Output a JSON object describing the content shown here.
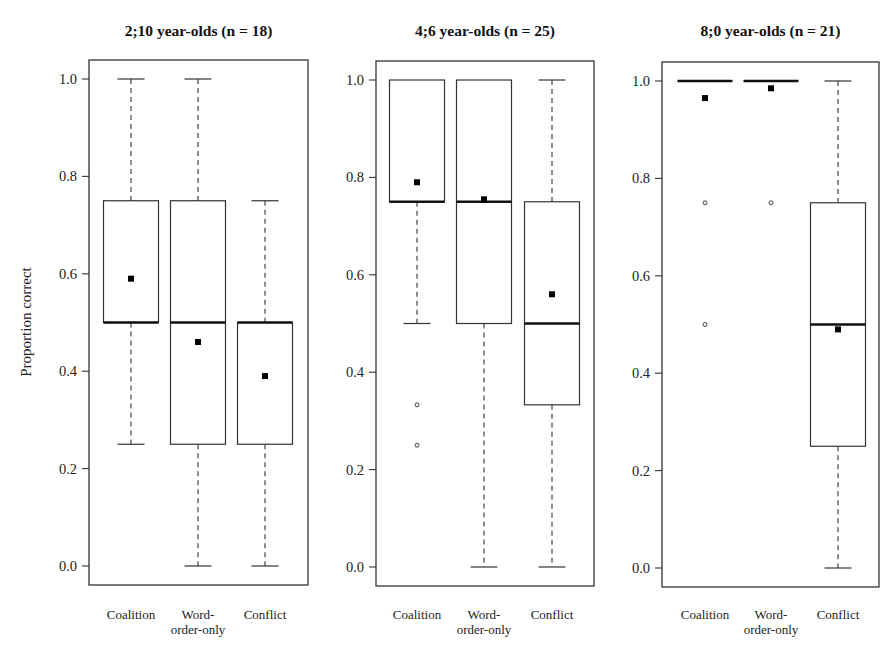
{
  "chart_data": {
    "type": "boxplot",
    "ylabel": "Proportion correct",
    "ylim": [
      0.0,
      1.0
    ],
    "yticks": [
      "0.0",
      "0.2",
      "0.4",
      "0.6",
      "0.8",
      "1.0"
    ],
    "categories": [
      "Coalition",
      "Word-\norder-only",
      "Conflict"
    ],
    "legend": "none; filled squares = means, open circles = outliers",
    "panels": [
      {
        "title": "2;10 year-olds (n = 18)",
        "series": [
          {
            "name": "Coalition",
            "min": 0.25,
            "q1": 0.5,
            "median": 0.5,
            "q3": 0.75,
            "max": 1.0,
            "mean": 0.59,
            "outliers": []
          },
          {
            "name": "Word-order-only",
            "min": 0.0,
            "q1": 0.25,
            "median": 0.5,
            "q3": 0.75,
            "max": 1.0,
            "mean": 0.46,
            "outliers": []
          },
          {
            "name": "Conflict",
            "min": 0.0,
            "q1": 0.25,
            "median": 0.5,
            "q3": 0.5,
            "max": 0.75,
            "mean": 0.39,
            "outliers": []
          }
        ]
      },
      {
        "title": "4;6 year-olds (n = 25)",
        "series": [
          {
            "name": "Coalition",
            "min": 0.5,
            "q1": 0.75,
            "median": 0.75,
            "q3": 1.0,
            "max": 1.0,
            "mean": 0.79,
            "outliers": [
              0.333,
              0.25
            ]
          },
          {
            "name": "Word-order-only",
            "min": 0.0,
            "q1": 0.5,
            "median": 0.75,
            "q3": 1.0,
            "max": 1.0,
            "mean": 0.755,
            "outliers": []
          },
          {
            "name": "Conflict",
            "min": 0.0,
            "q1": 0.333,
            "median": 0.5,
            "q3": 0.75,
            "max": 1.0,
            "mean": 0.56,
            "outliers": []
          }
        ]
      },
      {
        "title": "8;0 year-olds (n = 21)",
        "series": [
          {
            "name": "Coalition",
            "min": 1.0,
            "q1": 1.0,
            "median": 1.0,
            "q3": 1.0,
            "max": 1.0,
            "mean": 0.965,
            "outliers": [
              0.75,
              0.5
            ]
          },
          {
            "name": "Word-order-only",
            "min": 1.0,
            "q1": 1.0,
            "median": 1.0,
            "q3": 1.0,
            "max": 1.0,
            "mean": 0.985,
            "outliers": [
              0.75
            ]
          },
          {
            "name": "Conflict",
            "min": 0.0,
            "q1": 0.25,
            "median": 0.5,
            "q3": 0.75,
            "max": 1.0,
            "mean": 0.49,
            "outliers": []
          }
        ]
      }
    ]
  },
  "layout": {
    "panels": [
      {
        "left": 89,
        "right": 308,
        "top": 60,
        "bottom": 585,
        "y1": 79,
        "y0": 566,
        "centers": [
          131,
          198,
          265
        ]
      },
      {
        "left": 376,
        "right": 594,
        "top": 61,
        "bottom": 586,
        "y1": 80,
        "y0": 567,
        "centers": [
          417,
          484,
          552
        ]
      },
      {
        "left": 662,
        "right": 879,
        "top": 62,
        "bottom": 587,
        "y1": 81,
        "y0": 568,
        "centers": [
          705,
          771,
          838
        ]
      }
    ],
    "box_width": 55,
    "cap_width": 27
  }
}
